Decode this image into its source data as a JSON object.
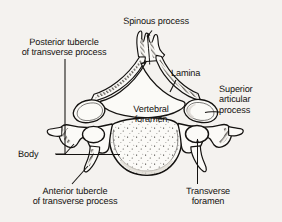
{
  "figure": {
    "background_color": "#f4f2ef",
    "ink_color": "#141210",
    "bone_fill": "#fbfaf7"
  },
  "labels": {
    "spinous_process": {
      "line1": "Spinous process"
    },
    "posterior_tubercle": {
      "line1": "Posterior tubercle",
      "line2": "of transverse process"
    },
    "lamina": {
      "line1": "Lamina"
    },
    "superior_articular_process": {
      "line1": "Superior",
      "line2": "articular",
      "line3": "process"
    },
    "vertebral_foramen": {
      "line1": "Vertebral",
      "line2": "foramen"
    },
    "body": {
      "line1": "Body"
    },
    "anterior_tubercle": {
      "line1": "Anterior tubercle",
      "line2": "of transverse process"
    },
    "transverse_foramen": {
      "line1": "Transverse",
      "line2": "foramen"
    }
  },
  "structures": [
    "spinous process",
    "lamina",
    "vertebral foramen",
    "superior articular process",
    "transverse foramen",
    "posterior tubercle of transverse process",
    "anterior tubercle of transverse process",
    "body"
  ]
}
